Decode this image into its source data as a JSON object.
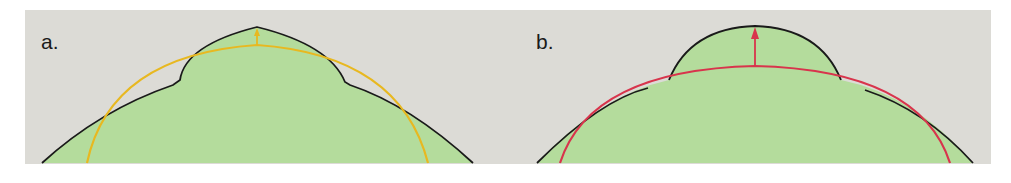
{
  "figure": {
    "background_color": "#dcdbd6",
    "fill_color": "#b4dc9c",
    "outline_color": "#1a1a1a",
    "panels": [
      {
        "id": "a",
        "label": "a.",
        "curve_color": "#e8b820",
        "arrow_color": "#e8b820",
        "description": "Green silhouette with a raised central dome on a broad hill; yellow fitted arc beneath the dome with a small upward arrow at the apex"
      },
      {
        "id": "b",
        "label": "b.",
        "curve_color": "#d8344c",
        "arrow_color": "#d8344c",
        "description": "Smooth dome atop a broad hill; red fitted arc beneath the dome with an upward arrow from the arc to the dome apex"
      }
    ]
  }
}
